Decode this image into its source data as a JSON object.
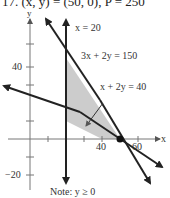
{
  "header": {
    "text": "17. (x, y) = (50, 0), P = 250"
  },
  "graph": {
    "axis_labels": {
      "x": "x",
      "y": "y"
    },
    "x_ticks": [
      {
        "label": "40"
      },
      {
        "label": "60"
      }
    ],
    "y_ticks": [
      {
        "label": "40"
      },
      {
        "label": "−20"
      }
    ],
    "lines": [
      {
        "label": "x = 20"
      },
      {
        "label": "3x + 2y = 150"
      },
      {
        "label": "x + 2y = 40"
      }
    ],
    "note": "Note: y ≥ 0",
    "optimal_point": {
      "x": 50,
      "y": 0
    },
    "colors": {
      "region": "#cccccc",
      "line": "#222222",
      "axis": "#777777"
    }
  }
}
